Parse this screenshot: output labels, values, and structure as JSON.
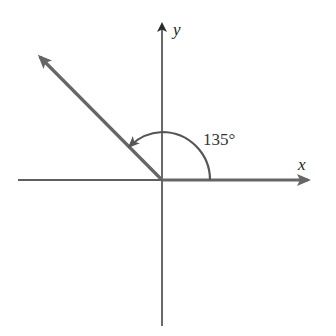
{
  "diagram": {
    "x_axis_label": "x",
    "y_axis_label": "y",
    "angle_label": "135°",
    "angle_degrees": 135,
    "colors": {
      "axis": "#2a2a2a",
      "ray": "#666666",
      "arc": "#555555",
      "text": "#222222",
      "background": "#ffffff"
    }
  }
}
